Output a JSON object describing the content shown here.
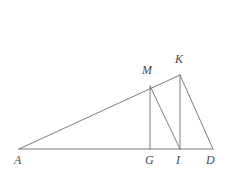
{
  "figure": {
    "type": "geometry-diagram",
    "background_color": "#ffffff",
    "stroke_color": "#6e6e6e",
    "label_color": "#4a4a4a",
    "stroke_width": 0.9,
    "canvas": {
      "width": 231,
      "height": 180
    }
  },
  "points": [
    {
      "id": "A",
      "label": "A",
      "x": 19,
      "y": 149,
      "label_x": 14,
      "label_y": 154
    },
    {
      "id": "G",
      "label": "G",
      "x": 150,
      "y": 149,
      "label_x": 145,
      "label_y": 154
    },
    {
      "id": "I",
      "label": "I",
      "x": 180,
      "y": 149,
      "label_x": 176,
      "label_y": 154
    },
    {
      "id": "D",
      "label": "D",
      "x": 213,
      "y": 149,
      "label_x": 206,
      "label_y": 154
    },
    {
      "id": "M",
      "label": "M",
      "x": 150,
      "y": 86,
      "label_x": 142,
      "label_y": 64
    },
    {
      "id": "K",
      "label": "K",
      "x": 180,
      "y": 75,
      "label_x": 175,
      "label_y": 53
    }
  ],
  "segments": [
    {
      "id": "base-AD",
      "from": "A",
      "to": "D",
      "description": "baseline from A to D"
    },
    {
      "id": "hypotenuse-AK",
      "from": "A",
      "to": "K",
      "description": "long slanted line from A through M up to K"
    },
    {
      "id": "altitude-MG",
      "from": "M",
      "to": "G",
      "description": "vertical segment from M down to G"
    },
    {
      "id": "altitude-KI",
      "from": "K",
      "to": "I",
      "description": "vertical segment from K down to I"
    },
    {
      "id": "diagonal-MI",
      "from": "M",
      "to": "I",
      "description": "diagonal segment from M down to I"
    },
    {
      "id": "diagonal-KD",
      "from": "K",
      "to": "D",
      "description": "diagonal segment from K down to D"
    }
  ]
}
